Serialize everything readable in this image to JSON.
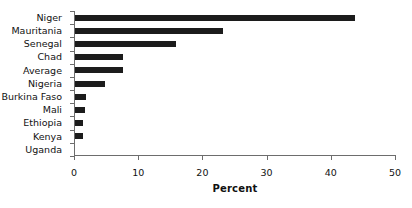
{
  "chart_data": {
    "type": "bar",
    "orientation": "horizontal",
    "title": "",
    "subtitle": "",
    "xlabel": "Percent",
    "ylabel": "",
    "xlim": [
      0,
      50
    ],
    "xticks": [
      0,
      10,
      20,
      30,
      40,
      50
    ],
    "xticklabels": [
      "0",
      "10",
      "20",
      "30",
      "40",
      "50"
    ],
    "grid": false,
    "legend": false,
    "bar_color": "#1c1c1c",
    "categories": [
      "Niger",
      "Mauritania",
      "Senegal",
      "Chad",
      "Average",
      "Nigeria",
      "Burkina Faso",
      "Mali",
      "Ethiopia",
      "Kenya",
      "Uganda"
    ],
    "values": [
      43.6,
      23.0,
      15.8,
      7.5,
      7.4,
      4.7,
      1.7,
      1.6,
      1.2,
      1.2,
      0.0
    ]
  }
}
